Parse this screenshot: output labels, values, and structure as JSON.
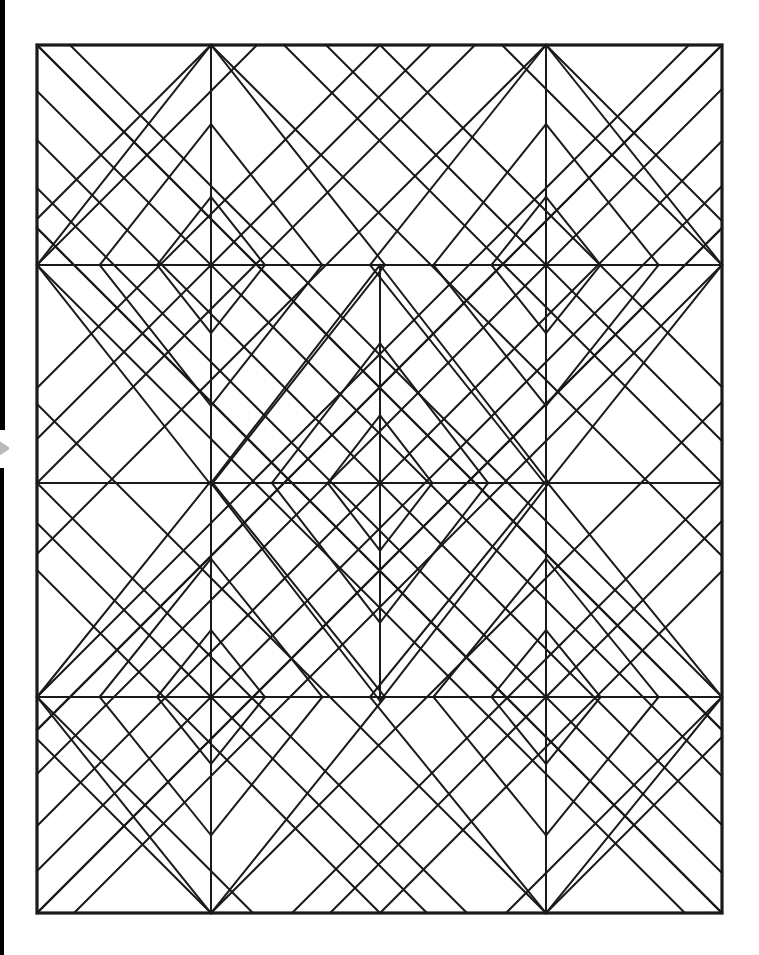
{
  "document": {
    "kind": "line-drawing",
    "title": "Geometric quilt block pattern",
    "background_color": "#ffffff",
    "ink_color": "#1a1a1a",
    "page_width": 759,
    "page_height": 955
  },
  "scan_artifacts": {
    "left_edge_color": "#000000",
    "left_edge_top": {
      "x": 0,
      "y": 0,
      "width": 5,
      "height": 436
    },
    "left_edge_bottom": {
      "x": 0,
      "y": 462,
      "width": 4,
      "height": 493
    },
    "notch_color": "#b9b9b9"
  },
  "chart_data": {
    "type": "diagram",
    "frame": {
      "x1": 37,
      "y1": 45,
      "x2": 722,
      "y2": 913
    },
    "frame_stroke_width": 3.2,
    "line_stroke_width": 2.0,
    "grid_x": [
      37,
      211,
      380,
      546,
      722
    ],
    "grid_y": [
      45,
      265,
      483,
      697,
      913
    ],
    "star_nodes": [
      {
        "x": 211,
        "y": 265,
        "rays": 8
      },
      {
        "x": 546,
        "y": 265,
        "rays": 8
      },
      {
        "x": 380,
        "y": 483,
        "rays": 8
      },
      {
        "x": 211,
        "y": 697,
        "rays": 8
      },
      {
        "x": 546,
        "y": 697,
        "rays": 8
      }
    ],
    "diamond_centers": [
      {
        "cx": 211,
        "cy": 265,
        "rx": 174,
        "ry": 220
      },
      {
        "cx": 546,
        "cy": 265,
        "rx": 176,
        "ry": 220
      },
      {
        "cx": 380,
        "cy": 483,
        "rx": 169,
        "ry": 218
      },
      {
        "cx": 211,
        "cy": 697,
        "rx": 174,
        "ry": 216
      },
      {
        "cx": 546,
        "cy": 697,
        "rx": 176,
        "ry": 216
      }
    ],
    "ring_fractions": [
      0.31,
      0.64,
      1.0
    ],
    "horizontal_rules_y": [
      265,
      483,
      697
    ],
    "vertical_rules_x": [
      211,
      546
    ],
    "block_columns": 2,
    "block_rows": 3
  }
}
